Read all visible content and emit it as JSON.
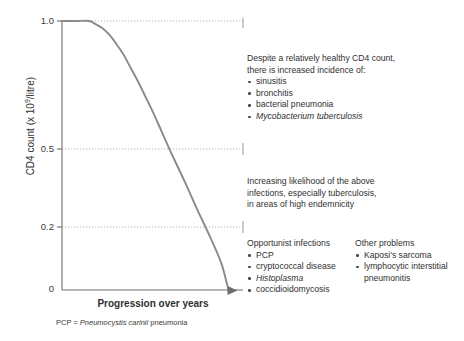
{
  "top_caption": "",
  "chart_data": {
    "type": "line",
    "title": "",
    "xlabel": "Progression over years",
    "ylabel": "CD4 count (x 10⁹/litre)",
    "ylabel_parts": {
      "pre": "CD4 count (x 10",
      "sup": "9",
      "post": "/litre)"
    },
    "ytick_labels": [
      "1.0",
      "0.5",
      "0.2",
      "0"
    ],
    "ytick_values": [
      1.0,
      0.5,
      0.2,
      0
    ],
    "ylim": [
      0,
      1.0
    ],
    "xlim": [
      0,
      1.0
    ],
    "xtick_labels": [],
    "gridlines": [
      1.0,
      0.5,
      0.2
    ],
    "grid_style": "dotted",
    "legend": "none",
    "series": [
      {
        "name": "CD4 count decline",
        "x": [
          0.0,
          0.08,
          0.15,
          0.18,
          0.22,
          0.26,
          0.3,
          0.34,
          0.38,
          0.42,
          0.46,
          0.5,
          0.55,
          0.61,
          0.68,
          0.75,
          0.82,
          0.88,
          0.92
        ],
        "y": [
          1.0,
          1.0,
          1.0,
          0.99,
          0.975,
          0.95,
          0.915,
          0.875,
          0.825,
          0.775,
          0.72,
          0.665,
          0.59,
          0.5,
          0.4,
          0.295,
          0.195,
          0.1,
          0.0
        ]
      }
    ],
    "annotations": [
      {
        "id": "early",
        "at_cd4": "above 0.5"
      },
      {
        "id": "mid",
        "at_cd4": "0.5 to 0.2"
      },
      {
        "id": "late",
        "at_cd4": "below 0.2"
      }
    ],
    "arrow_at_end": true,
    "curve_color": "#8a8a8a",
    "axis_color": "#6e6e6e",
    "grid_color": "#a8a8a8"
  },
  "annotations": {
    "early": {
      "header_line1": "Despite a relatively healthy CD4 count,",
      "header_line2": "there is increased incidence of:",
      "items": [
        {
          "text": "sinusitis",
          "italic": false
        },
        {
          "text": "bronchitis",
          "italic": false
        },
        {
          "text": "bacterial pneumonia",
          "italic": false
        },
        {
          "text": "Mycobacterium tuberculosis",
          "italic": true
        }
      ]
    },
    "mid": {
      "line1": "Increasing  likelihood of the above",
      "line2": "infections, especially tuberculosis,",
      "line3": "in areas  of high endemnicity"
    },
    "opportunist": {
      "header": "Opportunist infections",
      "items": [
        {
          "text": "PCP",
          "italic": false
        },
        {
          "text": "cryptococcal disease",
          "italic": false
        },
        {
          "text": "Histoplasma",
          "italic": true
        },
        {
          "text": "coccidioidomycosis",
          "italic": false
        }
      ]
    },
    "other": {
      "header": "Other problems",
      "items": [
        {
          "text": "Kaposi's sarcoma",
          "italic": false,
          "continuation": ""
        },
        {
          "text": "lymphocytic interstitial",
          "italic": false,
          "continuation": "pneumonitis"
        }
      ]
    }
  },
  "footnote": {
    "abbrev": "PCP = ",
    "italic_term": "Pneumocystis carinii",
    "suffix": " pneumonia"
  }
}
